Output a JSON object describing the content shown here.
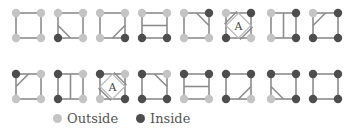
{
  "colors": {
    "outside": "#c4c4c4",
    "inside": "#4d4d4d",
    "edge": "#8c8c8c",
    "contour": "#8c8c8c",
    "ambiguous_inner": "#b8b8b8"
  },
  "layout": {
    "col_x": [
      16,
      58,
      100,
      142,
      184,
      226,
      271,
      313
    ],
    "row_y": [
      13,
      74
    ],
    "size": 25
  },
  "cases": [
    {
      "row": 0,
      "col": 0,
      "inside": [],
      "lines": []
    },
    {
      "row": 0,
      "col": 1,
      "inside": [
        "BL"
      ],
      "lines": [
        [
          "L",
          "B"
        ]
      ]
    },
    {
      "row": 0,
      "col": 2,
      "inside": [
        "BR"
      ],
      "lines": [
        [
          "R",
          "B"
        ]
      ]
    },
    {
      "row": 0,
      "col": 3,
      "inside": [
        "BL",
        "BR"
      ],
      "lines": [
        [
          "L",
          "R"
        ]
      ]
    },
    {
      "row": 0,
      "col": 4,
      "inside": [
        "TR"
      ],
      "lines": [
        [
          "T",
          "R"
        ]
      ]
    },
    {
      "row": 0,
      "col": 5,
      "inside": [
        "TR",
        "BL"
      ],
      "lines": [],
      "ambiguous": true,
      "label": "A"
    },
    {
      "row": 0,
      "col": 6,
      "inside": [
        "TR",
        "BR"
      ],
      "lines": [
        [
          "T",
          "B"
        ]
      ]
    },
    {
      "row": 0,
      "col": 7,
      "inside": [
        "TR",
        "BL",
        "BR"
      ],
      "lines": [
        [
          "T",
          "L"
        ]
      ]
    },
    {
      "row": 1,
      "col": 0,
      "inside": [
        "TL"
      ],
      "lines": [
        [
          "L",
          "T"
        ]
      ]
    },
    {
      "row": 1,
      "col": 1,
      "inside": [
        "TL",
        "BL"
      ],
      "lines": [
        [
          "T",
          "B"
        ]
      ]
    },
    {
      "row": 1,
      "col": 2,
      "inside": [
        "TL",
        "BR"
      ],
      "lines": [],
      "ambiguous": true,
      "label": "A"
    },
    {
      "row": 1,
      "col": 3,
      "inside": [
        "TL",
        "BL",
        "BR"
      ],
      "lines": [
        [
          "T",
          "R"
        ]
      ]
    },
    {
      "row": 1,
      "col": 4,
      "inside": [
        "TL",
        "TR"
      ],
      "lines": [
        [
          "L",
          "R"
        ]
      ]
    },
    {
      "row": 1,
      "col": 5,
      "inside": [
        "TL",
        "TR",
        "BL"
      ],
      "lines": [
        [
          "R",
          "B"
        ]
      ]
    },
    {
      "row": 1,
      "col": 6,
      "inside": [
        "TL",
        "TR",
        "BR"
      ],
      "lines": [
        [
          "L",
          "B"
        ]
      ]
    },
    {
      "row": 1,
      "col": 7,
      "inside": [
        "TL",
        "TR",
        "BL",
        "BR"
      ],
      "lines": []
    }
  ],
  "legend": {
    "outside_label": "Outside",
    "inside_label": "Inside"
  }
}
